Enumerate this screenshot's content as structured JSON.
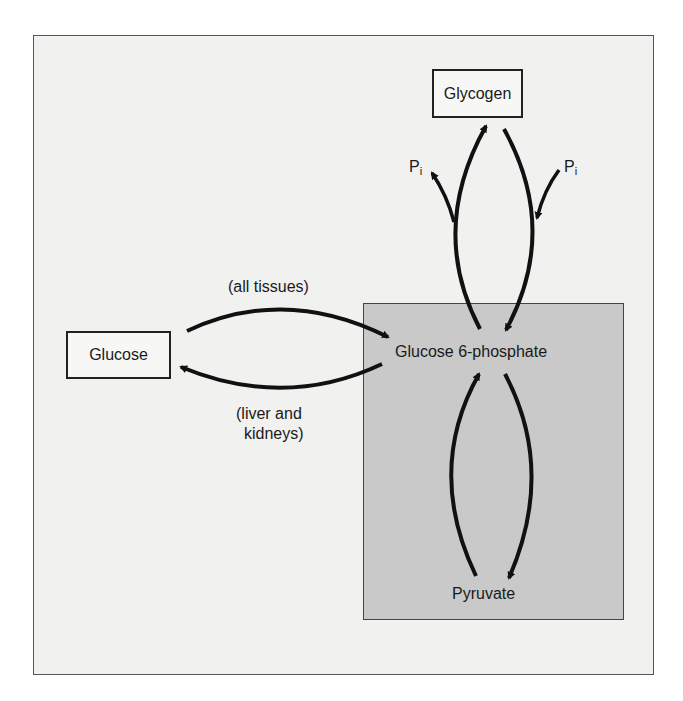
{
  "diagram": {
    "nodes": {
      "glycogen": "Glycogen",
      "glucose": "Glucose",
      "glucose6p": "Glucose 6-phosphate",
      "pyruvate": "Pyruvate"
    },
    "edge_labels": {
      "all_tissues": "(all tissues)",
      "liver_kidneys_line1": "(liver and",
      "liver_kidneys_line2": "kidneys)",
      "pi_left": "P",
      "pi_left_sub": "i",
      "pi_right": "P",
      "pi_right_sub": "i"
    },
    "colors": {
      "background": "#f1f1f0",
      "shaded_region": "#c9c9c9",
      "arrow": "#111111"
    }
  }
}
